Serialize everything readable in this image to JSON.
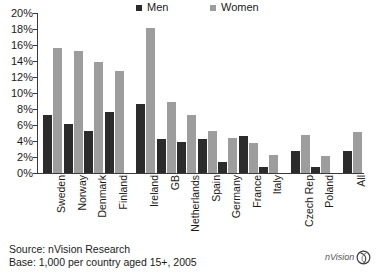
{
  "legend": {
    "men_label": "Men",
    "women_label": "Women",
    "men_color": "#2b2b2b",
    "women_color": "#9d9d9d"
  },
  "footer": {
    "source": "Source: nVision Research",
    "base": "Base: 1,000 per country aged 15+, 2005",
    "logo_text": "nVision"
  },
  "axis": {
    "y_ticks": [
      "0%",
      "2%",
      "4%",
      "6%",
      "8%",
      "10%",
      "12%",
      "14%",
      "16%",
      "18%",
      "20%"
    ]
  },
  "chart_data": {
    "type": "bar",
    "title": "",
    "subtitle": "",
    "xlabel": "",
    "ylabel": "",
    "ylim": [
      0,
      20
    ],
    "ytick_values": [
      0,
      2,
      4,
      6,
      8,
      10,
      12,
      14,
      16,
      18,
      20
    ],
    "ytick_labels": [
      "0%",
      "2%",
      "4%",
      "6%",
      "8%",
      "10%",
      "12%",
      "14%",
      "16%",
      "18%",
      "20%"
    ],
    "grid": false,
    "legend_position": "top",
    "units": "percent",
    "categories": [
      "Sweden",
      "Norway",
      "Denmark",
      "Finland",
      "Ireland",
      "GB",
      "Netherlands",
      "Spain",
      "Germany",
      "France",
      "Italy",
      "Czech Rep",
      "Poland",
      "All"
    ],
    "series": [
      {
        "name": "Men",
        "color": "#2b2b2b",
        "values": [
          7.2,
          6.1,
          5.3,
          7.6,
          8.6,
          4.3,
          3.9,
          4.2,
          1.4,
          4.6,
          0.7,
          2.7,
          0.8,
          2.7
        ]
      },
      {
        "name": "Women",
        "color": "#9d9d9d",
        "values": [
          15.6,
          15.2,
          13.9,
          12.8,
          18.1,
          8.9,
          7.2,
          5.3,
          4.4,
          3.8,
          2.3,
          4.8,
          2.1,
          5.1
        ]
      }
    ],
    "group_gaps_after": [
      "Finland",
      "Italy",
      "Poland"
    ]
  }
}
